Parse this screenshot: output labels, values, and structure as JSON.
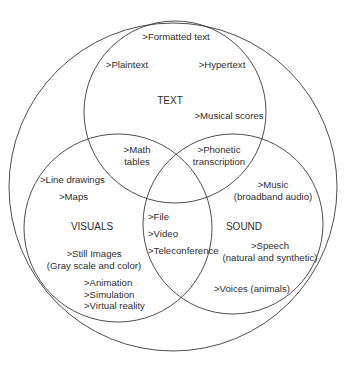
{
  "diagram": {
    "type": "venn",
    "outer": {
      "label": "",
      "cx": 173,
      "cy": 187,
      "r": 164
    },
    "circles": [
      {
        "id": "text",
        "label": "TEXT",
        "cx": 175,
        "cy": 112,
        "r": 91
      },
      {
        "id": "visuals",
        "label": "VISUALS",
        "cx": 118,
        "cy": 228,
        "r": 94
      },
      {
        "id": "sound",
        "label": "SOUND",
        "cx": 233,
        "cy": 224,
        "r": 90
      }
    ],
    "regions": {
      "outer_only": {
        "formatted_text": ">Formatted text"
      },
      "text": {
        "title": "TEXT",
        "plaintext": ">Plaintext",
        "hypertext": ">Hypertext",
        "musical_scores": ">Musical scores"
      },
      "text_visuals": {
        "math_line1": ">Math",
        "math_line2": "tables"
      },
      "text_sound": {
        "phonetic_line1": ">Phonetic",
        "phonetic_line2": "transcription"
      },
      "visuals": {
        "title": "VISUALS",
        "line_drawings": ">Line drawings",
        "maps": ">Maps",
        "still_images_line1": ">Still Images",
        "still_images_line2": "(Gray scale and color)",
        "animation": ">Animation",
        "simulation": ">Simulation",
        "virtual_reality": ">Virtual reality"
      },
      "visuals_sound": {
        "file": ">File",
        "video": ">Video",
        "teleconference": ">Teleconference"
      },
      "sound": {
        "title": "SOUND",
        "music_line1": ">Music",
        "music_line2": "(broadband audio)",
        "speech_line1": ">Speech",
        "speech_line2": "(natural and synthetic)",
        "voices": ">Voices (animals)"
      }
    },
    "colors": {
      "stroke": "#3a3a3a",
      "text": "#2e2e2e",
      "background": "#ffffff"
    }
  }
}
